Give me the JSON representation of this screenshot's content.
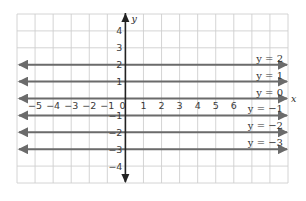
{
  "chart_data": {
    "type": "line",
    "title": "",
    "xlabel": "x",
    "ylabel": "y",
    "xlim": [
      -6,
      9
    ],
    "ylim": [
      -5,
      5
    ],
    "grid": true,
    "x_ticks": [
      "−5",
      "−4",
      "−3",
      "−2",
      "−1",
      "0",
      "1",
      "2",
      "3",
      "4",
      "5",
      "6"
    ],
    "x_tick_values": [
      -5,
      -4,
      -3,
      -2,
      -1,
      0,
      1,
      2,
      3,
      4,
      5,
      6
    ],
    "y_ticks": [
      "4",
      "3",
      "2",
      "1",
      "−1",
      "−2",
      "−3",
      "−4"
    ],
    "y_tick_values": [
      4,
      3,
      2,
      1,
      -1,
      -2,
      -3,
      -4
    ],
    "series": [
      {
        "name": "y = 2",
        "equation": "y = 2",
        "y": 2,
        "x": [
          -6,
          9
        ],
        "values": [
          2,
          2
        ]
      },
      {
        "name": "y = 1",
        "equation": "y = 1",
        "y": 1,
        "x": [
          -6,
          9
        ],
        "values": [
          1,
          1
        ]
      },
      {
        "name": "y = 0",
        "equation": "y = 0",
        "y": 0,
        "x": [
          -6,
          9
        ],
        "values": [
          0,
          0
        ]
      },
      {
        "name": "y = −1",
        "equation": "y = −1",
        "y": -1,
        "x": [
          -6,
          9
        ],
        "values": [
          -1,
          -1
        ]
      },
      {
        "name": "y = −2",
        "equation": "y = −2",
        "y": -2,
        "x": [
          -6,
          9
        ],
        "values": [
          -2,
          -2
        ]
      },
      {
        "name": "y = −3",
        "equation": "y = −3",
        "y": -3,
        "x": [
          -6,
          9
        ],
        "values": [
          -3,
          -3
        ]
      }
    ],
    "legend": "inline labels at right end of each line",
    "colors": {
      "grid": "#cfcfcf",
      "lines": "#6b6b6b",
      "axis": "#222222"
    }
  }
}
